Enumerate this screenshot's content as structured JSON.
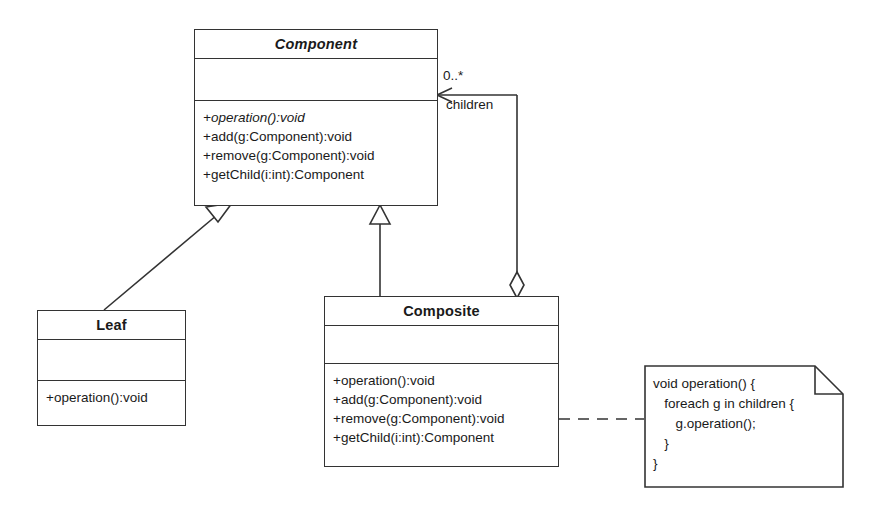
{
  "diagram": {
    "kind": "uml-class-diagram",
    "pattern_name": "Composite",
    "stroke_color": "#333333",
    "fill_color": "#ffffff",
    "background": "#ffffff"
  },
  "classes": {
    "component": {
      "name": "Component",
      "is_abstract": true,
      "attributes": [],
      "methods": [
        {
          "text": "+operation():void",
          "is_abstract": true
        },
        {
          "text": "+add(g:Component):void",
          "is_abstract": false
        },
        {
          "text": "+remove(g:Component):void",
          "is_abstract": false
        },
        {
          "text": "+getChild(i:int):Component",
          "is_abstract": false
        }
      ]
    },
    "leaf": {
      "name": "Leaf",
      "is_abstract": false,
      "attributes": [],
      "methods": [
        {
          "text": "+operation():void",
          "is_abstract": false
        }
      ]
    },
    "composite": {
      "name": "Composite",
      "is_abstract": false,
      "attributes": [],
      "methods": [
        {
          "text": "+operation():void",
          "is_abstract": false
        },
        {
          "text": "+add(g:Component):void",
          "is_abstract": false
        },
        {
          "text": "+remove(g:Component):void",
          "is_abstract": false
        },
        {
          "text": "+getChild(i:int):Component",
          "is_abstract": false
        }
      ]
    }
  },
  "association": {
    "type": "aggregation",
    "multiplicity": "0..*",
    "role_name": "children",
    "source": "Composite",
    "target": "Component"
  },
  "generalizations": [
    {
      "from": "Leaf",
      "to": "Component"
    },
    {
      "from": "Composite",
      "to": "Component"
    }
  ],
  "note": {
    "attached_to": "Composite",
    "link_style": "dashed",
    "lines": [
      "void operation() {",
      "   foreach g in children {",
      "      g.operation();",
      "   }",
      "}"
    ]
  }
}
